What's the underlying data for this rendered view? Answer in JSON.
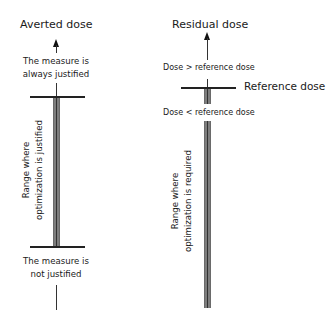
{
  "left_panel": {
    "title": "Averted dose",
    "top_label_line1": "The measure is",
    "top_label_line2": "always justified",
    "range_label_line1": "Range where",
    "range_label_line2": "optimization is justified",
    "bottom_label_line1": "The measure is",
    "bottom_label_line2": "not justified"
  },
  "right_panel": {
    "title": "Residual dose",
    "above_label": "Dose > reference dose",
    "threshold_label": "Reference dose",
    "below_label": "Dose < reference dose",
    "range_label_line1": "Range where",
    "range_label_line2": "optimization is required"
  },
  "colors": {
    "bar_fill": "#7d7d7d",
    "line": "#222222",
    "text": "#1a1a1a"
  }
}
